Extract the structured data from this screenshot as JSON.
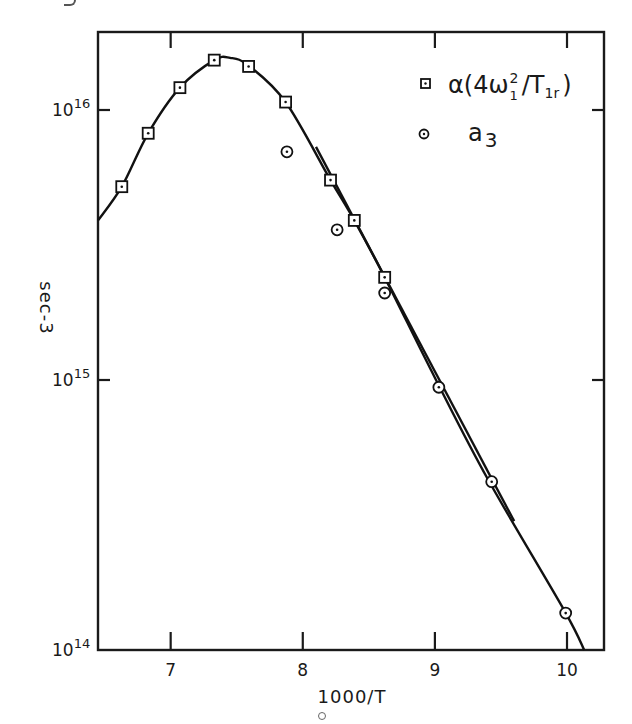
{
  "chart_data": {
    "type": "scatter",
    "title": "",
    "xlabel": "1000/T",
    "ylabel": "sec-3",
    "yscale": "log",
    "xlim": [
      6.45,
      10.28
    ],
    "ylim": [
      100000000000000.0,
      3.2e+16
    ],
    "x_ticks": [
      7,
      8,
      9,
      10
    ],
    "x_tick_labels": [
      "7",
      "8",
      "9",
      "10"
    ],
    "y_ticks": [
      100000000000000.0,
      1000000000000000.0,
      1e+16
    ],
    "y_tick_labels": [
      {
        "base": "10",
        "exp": "14"
      },
      {
        "base": "10",
        "exp": "15"
      },
      {
        "base": "10",
        "exp": "16"
      }
    ],
    "grid": false,
    "legend_position": "upper right",
    "legend": [
      {
        "marker": "square-dot",
        "label_main": "α(4ω",
        "label_sup": "2",
        "label_sub": "1",
        "label_tail": "/T",
        "label_tail_sub": "1r",
        "label_close": ")",
        "label_plain": "α(4ω₁²/T₁r)"
      },
      {
        "marker": "circle-dot",
        "label_main": "a",
        "label_sub": "3",
        "label_plain": "a₃"
      }
    ],
    "series": [
      {
        "name": "α(4ω₁²/T₁r)",
        "marker": "square",
        "x": [
          6.63,
          6.83,
          7.07,
          7.33,
          7.59,
          7.87,
          8.21,
          8.39,
          8.62
        ],
        "y": [
          5200000000000000.0,
          8200000000000000.0,
          1.21e+16,
          1.53e+16,
          1.45e+16,
          1.07e+16,
          5500000000000000.0,
          3900000000000000.0,
          2400000000000000.0
        ]
      },
      {
        "name": "a₃",
        "marker": "circle",
        "x": [
          7.88,
          8.26,
          8.62,
          9.03,
          9.43,
          9.99
        ],
        "y": [
          7000000000000000.0,
          3600000000000000.0,
          2100000000000000.0,
          940000000000000.0,
          420000000000000.0,
          137000000000000.0
        ]
      }
    ],
    "fit_lines": [
      {
        "name": "alpha-fit-curve",
        "x": [
          6.45,
          6.63,
          6.83,
          7.07,
          7.33,
          7.45,
          7.59,
          7.87,
          8.21,
          8.39,
          8.62,
          9.0,
          9.4,
          9.98,
          10.13
        ],
        "y": [
          3900000000000000.0,
          5200000000000000.0,
          8200000000000000.0,
          1.21e+16,
          1.53e+16,
          1.56e+16,
          1.46e+16,
          1.07e+16,
          5500000000000000.0,
          3900000000000000.0,
          2400000000000000.0,
          1020000000000000.0,
          430000000000000.0,
          140000000000000.0,
          100000000000000.0
        ]
      },
      {
        "name": "a3-fit-line",
        "x": [
          8.1,
          9.6
        ],
        "y": [
          7300000000000000.0,
          300000000000000.0
        ]
      }
    ]
  }
}
